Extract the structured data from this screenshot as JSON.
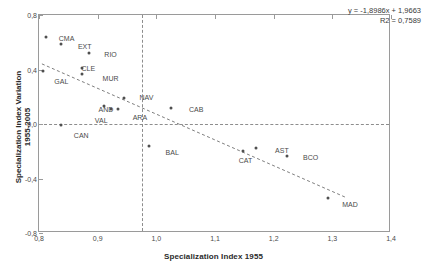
{
  "chart_data": {
    "type": "scatter",
    "title": "",
    "xlabel": "Specialization Index 1955",
    "ylabel_line1": "Specialization Index Variation",
    "ylabel_line2": "1955-2005",
    "xlim": [
      0.8,
      1.4
    ],
    "ylim": [
      -0.8,
      0.8
    ],
    "xticks": [
      "0,8",
      "0,9",
      "1,0",
      "1,1",
      "1,2",
      "1,3",
      "1,4"
    ],
    "xtick_values": [
      0.8,
      0.9,
      1.0,
      1.1,
      1.2,
      1.3,
      1.4
    ],
    "yticks": [
      "0,8",
      "0,4",
      "0,0",
      "-0,4",
      "-0,8"
    ],
    "ytick_values": [
      0.8,
      0.4,
      0.0,
      -0.4,
      -0.8
    ],
    "grid": false,
    "legend": "none",
    "reference_lines": {
      "horizontal_y": 0.0,
      "vertical_x": 0.975
    },
    "trendline": {
      "equation": "y = -1,8986x + 1,9663",
      "r2": "R2 = 0,7589",
      "slope": -1.8986,
      "intercept": 1.9663,
      "x_start": 0.805,
      "x_end": 1.325
    },
    "points": [
      {
        "label": "CMA",
        "x": 0.812,
        "y": 0.635,
        "lx": 0.847,
        "ly": 0.632
      },
      {
        "label": "EXT",
        "x": 0.837,
        "y": 0.588,
        "lx": 0.878,
        "ly": 0.57
      },
      {
        "label": "RIO",
        "x": 0.885,
        "y": 0.52,
        "lx": 0.922,
        "ly": 0.516
      },
      {
        "label": "CLE",
        "x": 0.873,
        "y": 0.41,
        "lx": 0.884,
        "ly": 0.414
      },
      {
        "label": "GAL",
        "x": 0.806,
        "y": 0.392,
        "lx": 0.838,
        "ly": 0.318
      },
      {
        "label": "MUR",
        "x": 0.874,
        "y": 0.37,
        "lx": 0.922,
        "ly": 0.338
      },
      {
        "label": "NAV",
        "x": 0.945,
        "y": 0.19,
        "lx": 0.983,
        "ly": 0.196
      },
      {
        "label": "AND",
        "x": 0.91,
        "y": 0.135,
        "lx": 0.914,
        "ly": 0.11
      },
      {
        "label": "VAL",
        "x": 0.922,
        "y": 0.108,
        "lx": 0.906,
        "ly": 0.026
      },
      {
        "label": "ARA",
        "x": 0.935,
        "y": 0.108,
        "lx": 0.972,
        "ly": 0.05
      },
      {
        "label": "CAB",
        "x": 1.025,
        "y": 0.116,
        "lx": 1.068,
        "ly": 0.113
      },
      {
        "label": "CAN",
        "x": 0.838,
        "y": -0.004,
        "lx": 0.872,
        "ly": -0.078
      },
      {
        "label": "BAL",
        "x": 0.988,
        "y": -0.163,
        "lx": 1.027,
        "ly": -0.208
      },
      {
        "label": "CAT",
        "x": 1.148,
        "y": -0.198,
        "lx": 1.152,
        "ly": -0.262
      },
      {
        "label": "AST",
        "x": 1.17,
        "y": -0.178,
        "lx": 1.214,
        "ly": -0.19
      },
      {
        "label": "BCO",
        "x": 1.222,
        "y": -0.238,
        "lx": 1.263,
        "ly": -0.243
      },
      {
        "label": "MAD",
        "x": 1.293,
        "y": -0.54,
        "lx": 1.33,
        "ly": -0.588
      }
    ]
  }
}
